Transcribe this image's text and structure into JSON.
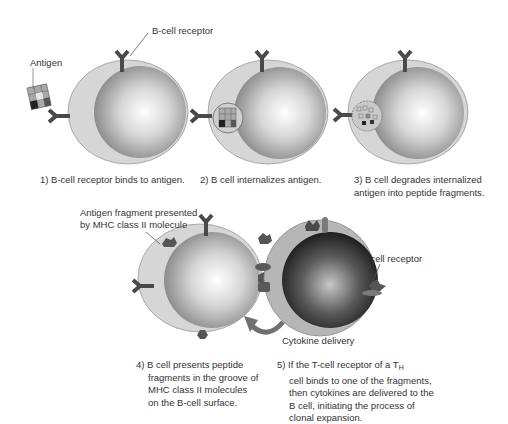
{
  "figure": {
    "type": "diagram",
    "colors": {
      "b_cell_outer": "#d4d4d4",
      "b_cell_nucleus_light": "#f8f8f8",
      "b_cell_nucleus_dark": "#8c8c8c",
      "t_cell_nucleus_light": "#bdbdbd",
      "t_cell_nucleus_dark": "#1a1a1a",
      "receptor": "#4a4a4a",
      "arrow": "#707070"
    },
    "labels": {
      "b_cell_receptor": "B-cell receptor",
      "antigen": "Antigen",
      "antigen_fragment_line1": "Antigen fragment presented",
      "antigen_fragment_line2": "by MHC class II molecule",
      "t_cell_receptor": "T-cell receptor",
      "cytokine_delivery": "Cytokine delivery"
    },
    "steps": [
      {
        "lines": [
          "1) B-cell receptor binds to antigen."
        ]
      },
      {
        "lines": [
          "2) B cell internalizes antigen."
        ]
      },
      {
        "lines": [
          "3) B cell degrades internalized",
          "antigen into peptide fragments."
        ]
      },
      {
        "lines": [
          "4) B cell presents peptide",
          "fragments in the groove of",
          "MHC class II molecules",
          "on the B-cell surface."
        ]
      },
      {
        "lines_prefix": "5) If the T-cell receptor of a T",
        "subscript": "H",
        "lines": [
          "cell binds to one of the fragments,",
          "then cytokines are delivered to the",
          "B cell, initiating the process of",
          "clonal expansion."
        ]
      }
    ]
  }
}
